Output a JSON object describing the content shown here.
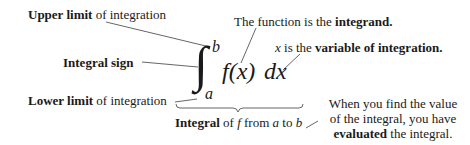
{
  "diagram": {
    "expression": {
      "integral_sign": "∫",
      "upper_limit": "b",
      "lower_limit": "a",
      "integrand": "f(x)",
      "differential": "dx"
    },
    "labels": {
      "upper_limit": {
        "bold": "Upper limit",
        "rest": " of integration"
      },
      "integral_sign": {
        "bold": "Integral sign",
        "rest": ""
      },
      "lower_limit": {
        "bold": "Lower limit",
        "rest": " of integration"
      },
      "integrand": {
        "prefix": "The function is the ",
        "bold": "integrand."
      },
      "variable": {
        "var": "x",
        "prefix": " is the ",
        "bold": "variable of integration."
      },
      "integral": {
        "bold": "Integral",
        "of": " of ",
        "f": "f",
        "from": " from ",
        "a": "a",
        "to": " to ",
        "b": "b"
      },
      "evaluated": {
        "line1": "When you find the value",
        "line2": "of the integral, you have",
        "line3_bold": "evaluated",
        "line3_rest": " the integral."
      }
    },
    "colors": {
      "text": "#1a1a1a",
      "lines": "#555555",
      "background": "#ffffff"
    }
  }
}
